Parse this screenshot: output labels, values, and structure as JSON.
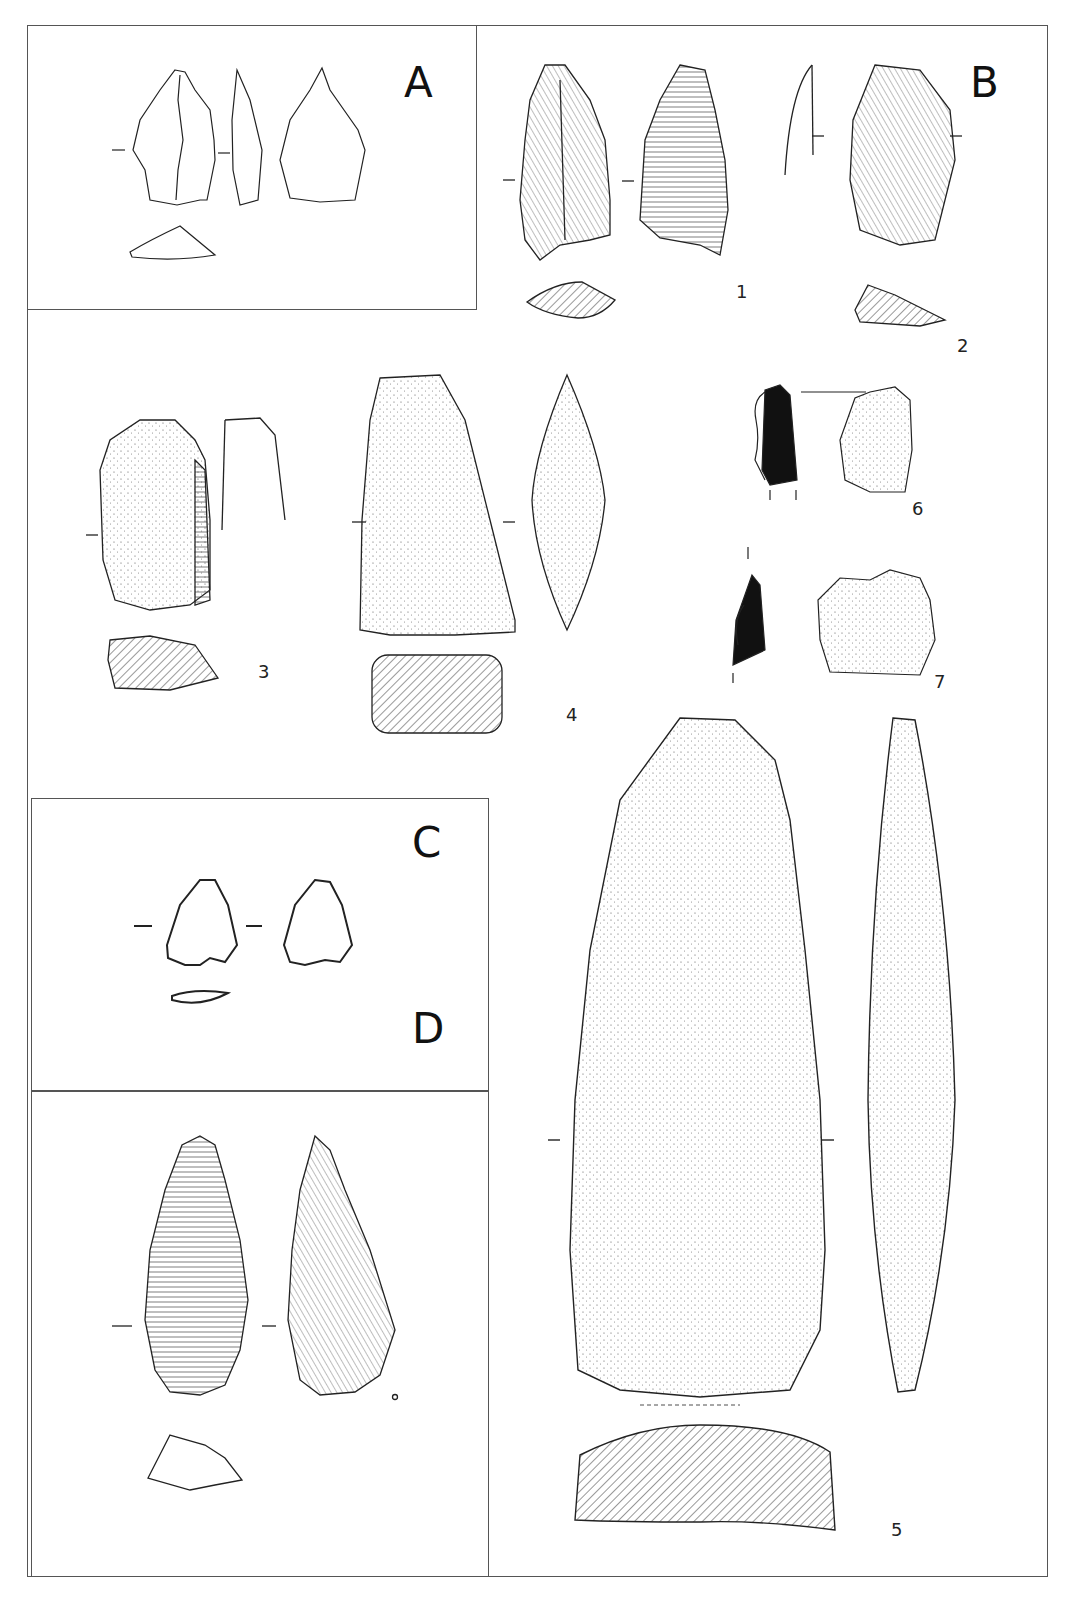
{
  "figure": {
    "panels": [
      {
        "id": "A",
        "label": "A"
      },
      {
        "id": "B",
        "label": "B"
      },
      {
        "id": "C",
        "label": "C"
      },
      {
        "id": "D",
        "label": "D"
      }
    ],
    "artifact_numbers": {
      "n1": "1",
      "n2": "2",
      "n3": "3",
      "n4": "4",
      "n5": "5",
      "n6": "6",
      "n7": "7"
    },
    "colors": {
      "line": "#222222",
      "frame": "#555555",
      "hatch": "#333333",
      "fill_black": "#111111",
      "background": "#ffffff"
    }
  }
}
